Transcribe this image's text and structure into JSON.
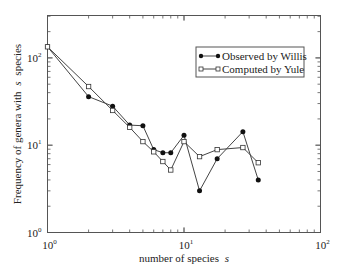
{
  "chart_data": {
    "type": "line",
    "title": "",
    "xlabel": "number of species  s",
    "ylabel": "Frequency of genera with s species",
    "xscale": "log",
    "yscale": "log",
    "xlim": [
      1,
      100
    ],
    "ylim": [
      1,
      300
    ],
    "grid": false,
    "legend_position": "upper right",
    "x_tick_labels": [
      "10^0",
      "10^1",
      "10^2"
    ],
    "y_tick_labels": [
      "10^0",
      "10^1",
      "10^2"
    ],
    "series": [
      {
        "name": "Observed by Willis",
        "marker": "filled-circle",
        "x": [
          1,
          2,
          3,
          4,
          5,
          6,
          7,
          8,
          10,
          13,
          17.5,
          27,
          35
        ],
        "y": [
          134,
          36,
          28,
          17,
          16.7,
          8.9,
          8.2,
          8.2,
          13,
          3.0,
          7.0,
          14.3,
          4.0
        ]
      },
      {
        "name": "Computed by Yule",
        "marker": "open-square",
        "x": [
          1,
          2,
          3,
          4,
          5,
          6,
          7,
          8,
          10,
          13,
          17.5,
          27,
          35
        ],
        "y": [
          134,
          47,
          25,
          16,
          11,
          8.4,
          6.5,
          5.2,
          11,
          7.4,
          8.9,
          9.4,
          6.3
        ]
      }
    ]
  },
  "axes": {
    "x_labels": {
      "base": "10",
      "exps": [
        "0",
        "1",
        "2"
      ]
    },
    "y_labels": {
      "base": "10",
      "exps": [
        "0",
        "1",
        "2"
      ]
    },
    "xlabel_main": "number of species",
    "xlabel_var": "s",
    "ylabel_pre": "Frequency of genera with",
    "ylabel_var": "s",
    "ylabel_post": "species"
  },
  "legend": {
    "items": [
      "Observed by Willis",
      "Computed by Yule"
    ]
  }
}
